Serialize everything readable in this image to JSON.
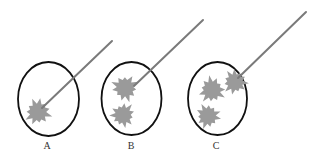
{
  "figure": {
    "colors": {
      "ellipse_stroke": "#111111",
      "star_fill": "#9a9a9a",
      "needle_stroke": "#7a7a7a",
      "label": "#333333"
    },
    "panels": [
      {
        "id": "A",
        "label": "A",
        "ellipse": {
          "cx": 48.5,
          "cy": 99,
          "rx": 30.5,
          "ry": 37
        },
        "needle": {
          "x1": 112,
          "y1": 41,
          "x2": 42,
          "y2": 108
        },
        "stars": [
          {
            "cx": 38,
            "cy": 112,
            "r": 15
          }
        ],
        "label_pos": {
          "x": 47,
          "y": 149
        }
      },
      {
        "id": "B",
        "label": "B",
        "ellipse": {
          "cx": 131.5,
          "cy": 98.5,
          "rx": 30,
          "ry": 36.5
        },
        "needle": {
          "x1": 203,
          "y1": 20,
          "x2": 134,
          "y2": 86
        },
        "stars": [
          {
            "cx": 125,
            "cy": 88,
            "r": 15
          },
          {
            "cx": 123,
            "cy": 115,
            "r": 14
          }
        ],
        "label_pos": {
          "x": 131,
          "y": 149
        }
      },
      {
        "id": "C",
        "label": "C",
        "ellipse": {
          "cx": 217.5,
          "cy": 98.5,
          "rx": 29.5,
          "ry": 36.5
        },
        "needle": {
          "x1": 306,
          "y1": 12,
          "x2": 238,
          "y2": 78
        },
        "stars": [
          {
            "cx": 212,
            "cy": 90,
            "r": 15
          },
          {
            "cx": 235,
            "cy": 82,
            "r": 14
          },
          {
            "cx": 208,
            "cy": 116,
            "r": 14
          }
        ],
        "label_pos": {
          "x": 216,
          "y": 149
        }
      }
    ]
  }
}
